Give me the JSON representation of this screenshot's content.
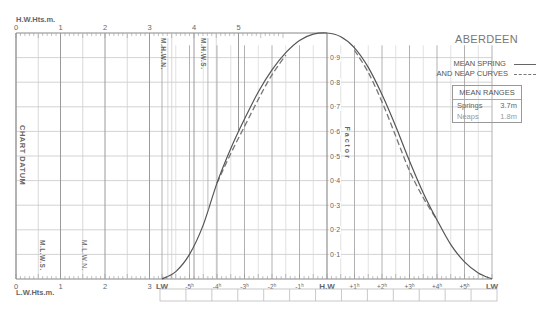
{
  "header": {
    "port_name": "ABERDEEN",
    "hw_heights_label": "H.W.Hts.m.",
    "lw_heights_label": "L.W.Hts.m."
  },
  "legend": {
    "line1": "MEAN SPRING",
    "line2": "AND NEAP CURVES",
    "spring_style": "solid",
    "neap_style": "dashed"
  },
  "mean_ranges": {
    "title": "MEAN RANGES",
    "springs_label": "Springs",
    "springs_value": "3.7m",
    "neaps_label": "Neaps",
    "neaps_value": "1.8m"
  },
  "labels": {
    "chart_datum": "CHART DATUM",
    "factor": "Factor",
    "mhws": "M.H.W.S.",
    "mhwn": "M.H.W.N.",
    "mlws": "M.L.W.S.",
    "mlwn": "M.L.W.N."
  },
  "chart_data": {
    "type": "line",
    "title": "ABERDEEN",
    "xlabel": "Hours relative to High Water",
    "ylabel": "Factor",
    "x_tick_labels": [
      "LW",
      "-5h",
      "-4h",
      "-3h",
      "-2h",
      "-1h",
      "H.W",
      "+1h",
      "+2h",
      "+3h",
      "+4h",
      "+5h",
      "LW"
    ],
    "y_tick_labels": [
      "0.1",
      "0.2",
      "0.3",
      "0.4",
      "0.5",
      "0.6",
      "0.7",
      "0.8",
      "0.9"
    ],
    "ylim": [
      0,
      1
    ],
    "height_scale_ticks": [
      "0",
      "1",
      "2",
      "3",
      "4",
      "5"
    ],
    "height_markers": {
      "MHWS": 4.2,
      "MHWN": 3.3,
      "MLWN": 1.6,
      "MLWS": 0.6
    },
    "grid": true,
    "series": [
      {
        "name": "Mean Spring Curve",
        "style": "solid",
        "x": [
          -6.0,
          -5.5,
          -5.0,
          -4.5,
          -4.0,
          -3.5,
          -3.0,
          -2.5,
          -2.0,
          -1.5,
          -1.0,
          -0.5,
          0,
          0.5,
          1.0,
          1.5,
          2.0,
          2.5,
          3.0,
          3.5,
          4.0,
          4.5,
          5.0,
          5.5,
          6.0
        ],
        "values": [
          0.0,
          0.03,
          0.1,
          0.22,
          0.39,
          0.53,
          0.65,
          0.76,
          0.85,
          0.92,
          0.97,
          0.995,
          1.0,
          0.985,
          0.94,
          0.86,
          0.75,
          0.62,
          0.48,
          0.35,
          0.24,
          0.14,
          0.07,
          0.025,
          0.0
        ]
      },
      {
        "name": "Mean Neap Curve",
        "style": "dashed",
        "x": [
          -4.0,
          -3.5,
          -3.0,
          -2.5,
          -2.0,
          -1.5,
          1.0,
          1.5,
          2.0,
          2.5,
          3.0,
          3.5,
          4.0
        ],
        "values": [
          0.39,
          0.51,
          0.62,
          0.73,
          0.83,
          0.91,
          0.93,
          0.84,
          0.72,
          0.58,
          0.44,
          0.33,
          0.24
        ]
      }
    ],
    "legend_position": "top-right"
  }
}
